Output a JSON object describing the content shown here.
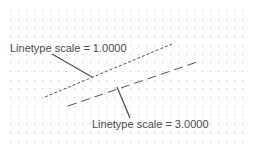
{
  "diagram": {
    "background": "#ffffff",
    "grid": {
      "dot_color": "#c8c8c8",
      "x_start": 10,
      "x_end": 242,
      "x_step": 8,
      "y_start": 10,
      "y_end": 149,
      "y_step": 8.7
    },
    "labels": [
      {
        "id": "top",
        "text": "Linetype scale = 1.0000"
      },
      {
        "id": "bottom",
        "text": "Linetype scale = 3.0000"
      }
    ],
    "lines": [
      {
        "name": "linetype-scale-1",
        "x1": 45,
        "y1": 97,
        "x2": 172,
        "y2": 44,
        "dash": "3,2",
        "color": "#505050"
      },
      {
        "name": "linetype-scale-3",
        "x1": 68,
        "y1": 106,
        "x2": 200,
        "y2": 61,
        "dash": "9,5",
        "color": "#505050"
      }
    ],
    "leaders": [
      {
        "name": "leader-top",
        "points": "52,54 92,77"
      },
      {
        "name": "leader-bottom",
        "points": "117,87 130,118"
      }
    ],
    "line_color": "#505050"
  }
}
